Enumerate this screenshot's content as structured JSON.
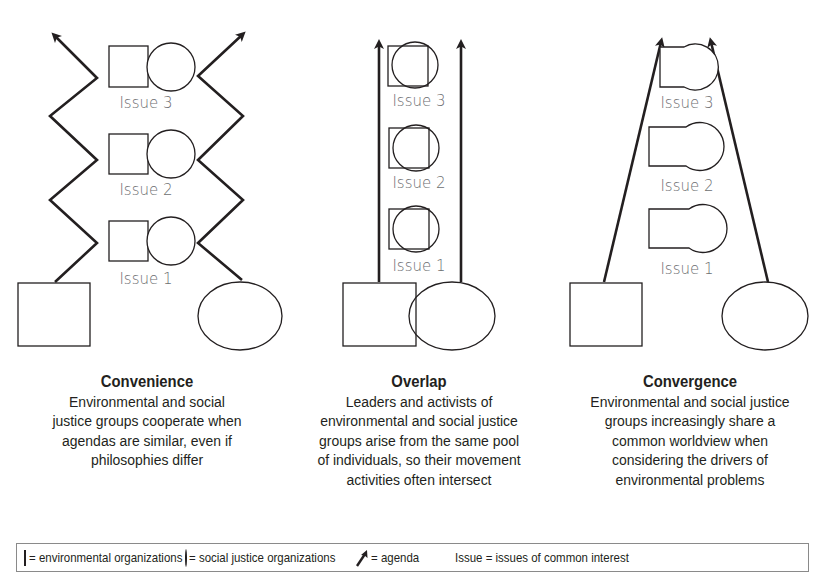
{
  "diagram": {
    "issue_labels": [
      "Issue 3",
      "Issue 2",
      "Issue 1"
    ],
    "panels": [
      {
        "id": "convenience",
        "title": "Convenience",
        "description": "Environmental and social justice groups cooperate when agendas are similar, even if philosophies differ",
        "lines": [
          "Environmental and social",
          "justice groups cooperate when",
          "agendas are similar, even if",
          "philosophies differ"
        ],
        "issue_shape_relation": "separate"
      },
      {
        "id": "overlap",
        "title": "Overlap",
        "description": "Leaders and activists of environmental and social justice groups arise from the same pool of individuals, so their movement activities often intersect",
        "lines": [
          "Leaders and activists of",
          "environmental and social justice",
          "groups arise from the same pool",
          "of individuals, so their movement",
          "activities often intersect"
        ],
        "issue_shape_relation": "overlapping"
      },
      {
        "id": "convergence",
        "title": "Convergence",
        "description": "Environmental and social justice groups increasingly share a common worldview when considering the drivers of environmental problems",
        "lines": [
          "Environmental and social justice",
          "groups increasingly share a",
          "common worldview when",
          "considering the drivers of",
          "environmental problems"
        ],
        "issue_shape_relation": "merged"
      }
    ],
    "legend": {
      "items": [
        {
          "symbol": "square",
          "label": "= environmental organizations"
        },
        {
          "symbol": "circle",
          "label": "= social justice organizations"
        },
        {
          "symbol": "arrow",
          "label": "= agenda"
        },
        {
          "symbol": "text",
          "symbol_text": "Issue",
          "label": "= issues of common interest"
        }
      ]
    },
    "colors": {
      "stroke": "#231f20",
      "issue_text": "#6d6e71",
      "legend_border": "#8a8a8a"
    }
  }
}
